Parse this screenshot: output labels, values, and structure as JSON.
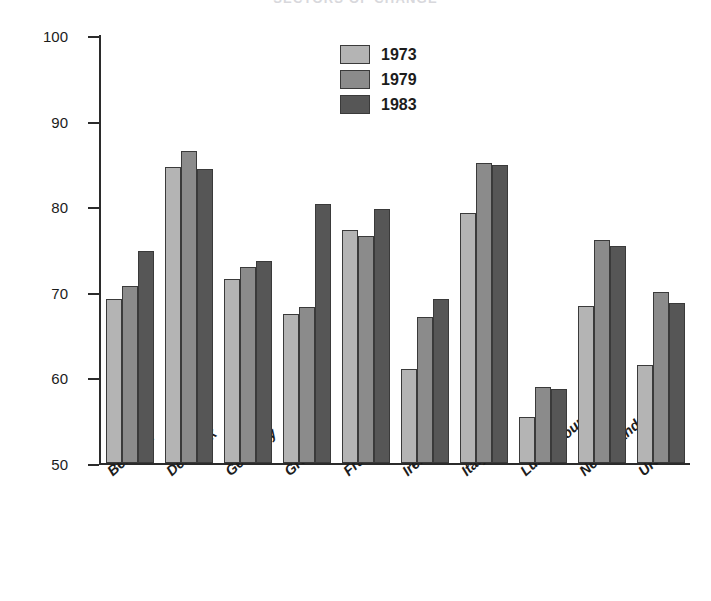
{
  "chart_data": {
    "type": "bar",
    "title": "SECTORS OF CHANGE",
    "xlabel": "",
    "ylabel": "Hourly earnings (percent of mens earnings,\nmanufacturing, EC)",
    "ylim": [
      50,
      100
    ],
    "yticks": [
      50,
      60,
      70,
      80,
      90,
      100
    ],
    "ytick_labels": [
      "50",
      "60",
      "70",
      "80",
      "90",
      "100"
    ],
    "grid": false,
    "legend_position": "top-center",
    "categories": [
      "Belgium",
      "Denmark",
      "Germany",
      "Greece",
      "France",
      "Ireland",
      "Italy",
      "Luxembourg",
      "Netherlands",
      "UK"
    ],
    "series": [
      {
        "name": "1973",
        "color": "#b4b4b4",
        "values": [
          69.2,
          84.6,
          71.5,
          67.4,
          77.2,
          61.0,
          79.2,
          55.4,
          68.3,
          61.4
        ]
      },
      {
        "name": "1979",
        "color": "#8b8b8b",
        "values": [
          70.7,
          86.5,
          72.9,
          68.2,
          76.5,
          67.1,
          85.0,
          58.9,
          76.0,
          70.0
        ]
      },
      {
        "name": "1983",
        "color": "#565656",
        "values": [
          74.8,
          84.3,
          73.6,
          80.3,
          79.7,
          69.2,
          84.8,
          58.6,
          75.4,
          68.7
        ]
      }
    ]
  }
}
